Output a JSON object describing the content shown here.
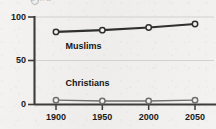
{
  "figure": {
    "background_color": "#f2f1ef",
    "ink_color": "#1b1b1b",
    "top_clipped_remnant": "a m a"
  },
  "chart_data": {
    "type": "line",
    "title": "",
    "subtitle": "",
    "xlabel": "",
    "ylabel": "",
    "x": [
      1900,
      1950,
      2000,
      2050
    ],
    "tick_labels_x": [
      "1900",
      "1950",
      "2000",
      "2050"
    ],
    "tick_labels_y": [
      "0",
      "50",
      "100"
    ],
    "yticks": [
      0,
      50,
      100
    ],
    "ylim": [
      0,
      100
    ],
    "xlim": [
      1880,
      2065
    ],
    "grid": true,
    "grid_axis": "y",
    "legend": "inline-labels",
    "markers": "open-circle",
    "series": [
      {
        "name": "Muslims",
        "values": [
          83,
          85,
          88,
          92
        ],
        "color": "#2f2f2f",
        "line_width": 2.1,
        "label_x": 1934,
        "label_y": 66
      },
      {
        "name": "Christians",
        "values": [
          5,
          4,
          4,
          5
        ],
        "color": "#6f6f6f",
        "line_width": 1.5,
        "label_x": 1934,
        "label_y": 24
      }
    ]
  },
  "axis": {
    "y_labels": [
      {
        "text": "100",
        "value": 100
      },
      {
        "text": "50",
        "value": 50
      },
      {
        "text": "0",
        "value": 0
      }
    ],
    "x_labels": [
      {
        "text": "1900",
        "value": 1900
      },
      {
        "text": "1950",
        "value": 1950
      },
      {
        "text": "2000",
        "value": 2000
      },
      {
        "text": "2050",
        "value": 2050
      }
    ]
  }
}
